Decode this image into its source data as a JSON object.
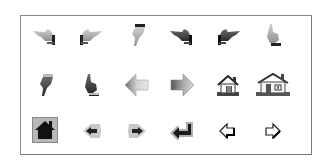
{
  "panel": {
    "rows": 3,
    "columns": 6
  },
  "icons": [
    {
      "name": "hand-pointing-left-icon",
      "row": 0,
      "col": 0,
      "style": "light"
    },
    {
      "name": "hand-pointing-right-icon",
      "row": 0,
      "col": 1,
      "style": "light"
    },
    {
      "name": "hand-pointing-down-icon",
      "row": 0,
      "col": 2,
      "style": "light"
    },
    {
      "name": "hand-pointing-left-dark-icon",
      "row": 0,
      "col": 3,
      "style": "dark"
    },
    {
      "name": "hand-pointing-right-dark-icon",
      "row": 0,
      "col": 4,
      "style": "dark"
    },
    {
      "name": "hand-pointing-up-icon",
      "row": 0,
      "col": 5,
      "style": "light"
    },
    {
      "name": "hand-pointing-down-dark-icon",
      "row": 1,
      "col": 0,
      "style": "dark"
    },
    {
      "name": "hand-pointing-up-dark-icon",
      "row": 1,
      "col": 1,
      "style": "dark"
    },
    {
      "name": "arrow-left-gradient-icon",
      "row": 1,
      "col": 2,
      "style": "gradient"
    },
    {
      "name": "arrow-right-gradient-icon",
      "row": 1,
      "col": 3,
      "style": "gradient"
    },
    {
      "name": "house-small-icon",
      "row": 1,
      "col": 4,
      "style": "outline"
    },
    {
      "name": "house-large-icon",
      "row": 1,
      "col": 5,
      "style": "outline"
    },
    {
      "name": "home-button-icon",
      "row": 2,
      "col": 0,
      "style": "filled"
    },
    {
      "name": "arrow-left-small-icon",
      "row": 2,
      "col": 1,
      "style": "filled"
    },
    {
      "name": "arrow-right-small-icon",
      "row": 2,
      "col": 2,
      "style": "filled"
    },
    {
      "name": "return-arrow-icon",
      "row": 2,
      "col": 3,
      "style": "filled"
    },
    {
      "name": "arrow-left-outline-icon",
      "row": 2,
      "col": 4,
      "style": "outline"
    },
    {
      "name": "arrow-right-outline-icon",
      "row": 2,
      "col": 5,
      "style": "outline"
    }
  ],
  "colors": {
    "frame_border": "#8a8a8a",
    "background": "#ffffff",
    "icon_dark": "#222222",
    "icon_mid": "#777777",
    "icon_light": "#bdbdbd"
  }
}
